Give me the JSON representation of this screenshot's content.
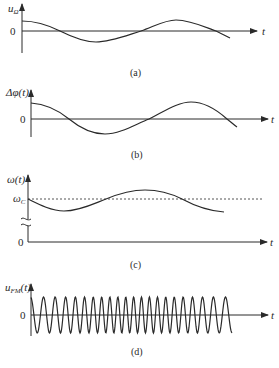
{
  "figure": {
    "panels": [
      {
        "id": "a",
        "caption": "(a)",
        "y_label": "u",
        "y_label_sub": "Ω",
        "origin_label": "0",
        "x_label": "t",
        "description": "Modulating signal, cosine-like"
      },
      {
        "id": "b",
        "caption": "(b)",
        "y_label": "Δφ(t)",
        "origin_label": "0",
        "x_label": "t",
        "description": "Phase deviation, same shape as modulating signal"
      },
      {
        "id": "c",
        "caption": "(c)",
        "y_label": "ω(t)",
        "ref_label": "ω",
        "ref_label_sub": "C",
        "origin_label": "0",
        "x_label": "t",
        "description": "Instantaneous frequency oscillating about carrier ωc (dashed), broken axis"
      },
      {
        "id": "d",
        "caption": "(d)",
        "y_label": "u",
        "y_label_sub": "FM",
        "y_label_suffix": "(t)",
        "origin_label": "0",
        "x_label": "t",
        "description": "FM/PM waveform with varying instantaneous frequency"
      }
    ]
  }
}
